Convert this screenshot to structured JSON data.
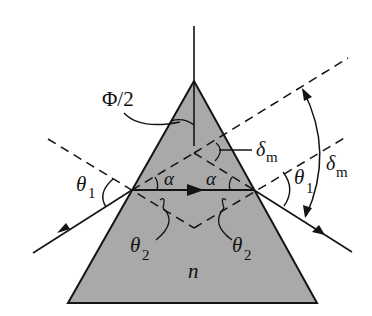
{
  "diagram": {
    "colors": {
      "prism_fill": "#a9a9a9",
      "stroke": "#141414",
      "background": "#ffffff"
    },
    "labels": {
      "apex_half_angle": "Φ/2",
      "delta_inner": "δ",
      "delta_inner_sub": "m",
      "delta_outer": "δ",
      "delta_outer_sub": "m",
      "theta1_left": "θ",
      "theta1_left_sub": "1",
      "theta1_right": "θ",
      "theta1_right_sub": "1",
      "alpha_left": "α",
      "alpha_right": "α",
      "theta2_left": "θ",
      "theta2_left_sub": "2",
      "theta2_right": "θ",
      "theta2_right_sub": "2",
      "refractive_index": "n"
    }
  }
}
